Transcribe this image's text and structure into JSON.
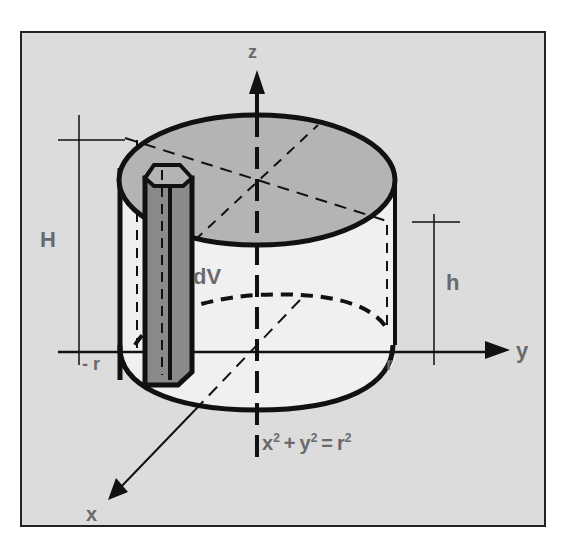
{
  "header": {
    "cutoff_title": ""
  },
  "figure": {
    "background": "#dcdcdc",
    "top_fill": "#b4b4b4",
    "column_fill": "#8a8a8a",
    "side_fill": "#f0f0f0",
    "label_color": "#6a6a6a",
    "axes": {
      "z": "z",
      "y": "y",
      "x": "x"
    },
    "labels": {
      "H": "H",
      "h": "h",
      "dV": "dV",
      "neg_r": "- r",
      "r": "r"
    },
    "equation": {
      "x": "x",
      "y": "y",
      "r": "r",
      "exp": "2",
      "plus": "+",
      "eq": "="
    }
  }
}
